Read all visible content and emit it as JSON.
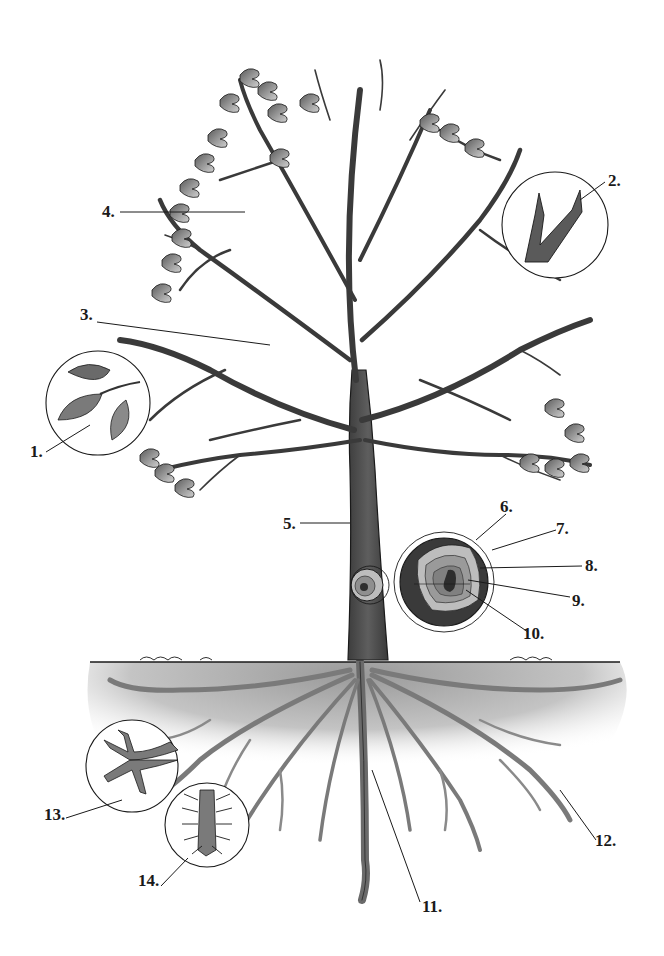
{
  "diagram": {
    "colors": {
      "background": "#ffffff",
      "ink": "#1a1a1a",
      "bark": "#4a4a4a",
      "leaf": "#7a7a7a",
      "soil": "#b8b8b8",
      "ring_outer": "#3a3a3a",
      "ring_light": "#bdbdbd",
      "ring_mid": "#8f8f8f",
      "heartwood": "#2e2e2e"
    },
    "labels": [
      {
        "id": "1",
        "text": "1.",
        "x": 30,
        "y": 443,
        "target": "leaf-inset"
      },
      {
        "id": "2",
        "text": "2.",
        "x": 608,
        "y": 172,
        "target": "bud-inset"
      },
      {
        "id": "3",
        "text": "3.",
        "x": 80,
        "y": 306,
        "target": "branch"
      },
      {
        "id": "4",
        "text": "4.",
        "x": 102,
        "y": 203,
        "target": "twig"
      },
      {
        "id": "5",
        "text": "5.",
        "x": 283,
        "y": 515,
        "target": "trunk"
      },
      {
        "id": "6",
        "text": "6.",
        "x": 500,
        "y": 498,
        "target": "bark-ring"
      },
      {
        "id": "7",
        "text": "7.",
        "x": 556,
        "y": 520,
        "target": "cambium-ring"
      },
      {
        "id": "8",
        "text": "8.",
        "x": 585,
        "y": 557,
        "target": "sapwood-ring"
      },
      {
        "id": "9",
        "text": "9.",
        "x": 572,
        "y": 592,
        "target": "heartwood-ring"
      },
      {
        "id": "10",
        "text": "10.",
        "x": 523,
        "y": 625,
        "target": "pith"
      },
      {
        "id": "11",
        "text": "11.",
        "x": 422,
        "y": 898,
        "target": "taproot"
      },
      {
        "id": "12",
        "text": "12.",
        "x": 595,
        "y": 832,
        "target": "lateral-root"
      },
      {
        "id": "13",
        "text": "13.",
        "x": 44,
        "y": 806,
        "target": "root-tip-inset"
      },
      {
        "id": "14",
        "text": "14.",
        "x": 138,
        "y": 872,
        "target": "root-hair-inset"
      }
    ]
  }
}
